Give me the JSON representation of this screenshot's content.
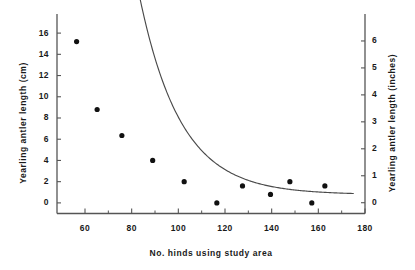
{
  "chart_data": {
    "type": "scatter",
    "title": "",
    "xlabel": "No. hinds using study area",
    "ylabel": "Yearling antler length (cm)",
    "ylabel_right": "Yearling antler length (inches)",
    "xlim": [
      48,
      180
    ],
    "ylim": [
      -1.0,
      17.8
    ],
    "ylim_right": [
      -0.4,
      7.0
    ],
    "grid": false,
    "legend": null,
    "xticks": [
      60,
      80,
      100,
      120,
      140,
      160,
      180
    ],
    "xticklabels": [
      "60",
      "80",
      "100",
      "120",
      "140",
      "160",
      "180"
    ],
    "xminorticks": [
      70,
      90,
      110,
      130,
      150,
      170
    ],
    "yticks": [
      0,
      2,
      4,
      6,
      8,
      10,
      12,
      14,
      16
    ],
    "yticklabels": [
      "0",
      "2",
      "4",
      "6",
      "8",
      "10",
      "12",
      "14",
      "16"
    ],
    "yticks_right": [
      0,
      1,
      2,
      3,
      4,
      5,
      6
    ],
    "yticklabels_right": [
      "0",
      "1",
      "2",
      "3",
      "4",
      "5",
      "6"
    ],
    "unit_conversion": "1 inch = 2.54 cm",
    "marker": "filled-circle",
    "marker_color": "#111111",
    "line_color": "#4a4a4a",
    "axis_color": "#555555",
    "points": [
      {
        "x": 56.4,
        "y": 15.2
      },
      {
        "x": 65.2,
        "y": 8.8
      },
      {
        "x": 75.8,
        "y": 6.35
      },
      {
        "x": 89.0,
        "y": 4.0
      },
      {
        "x": 102.5,
        "y": 2.0
      },
      {
        "x": 116.5,
        "y": 0.0
      },
      {
        "x": 127.5,
        "y": 1.6
      },
      {
        "x": 139.5,
        "y": 0.8
      },
      {
        "x": 147.8,
        "y": 2.0
      },
      {
        "x": 157.2,
        "y": 0.0
      },
      {
        "x": 162.8,
        "y": 1.6
      }
    ],
    "fit_curve": {
      "description": "exponential decay fit to an asymptote",
      "x_start": 52.0,
      "x_end": 175.0,
      "asymptote": 0.78,
      "amplitude": 110.0,
      "decay_rate": 0.0565,
      "samples": [
        {
          "x": 52.0,
          "y": 17.6
        },
        {
          "x": 56.0,
          "y": 15.0
        },
        {
          "x": 60.0,
          "y": 12.4
        },
        {
          "x": 64.0,
          "y": 10.4
        },
        {
          "x": 68.0,
          "y": 8.8
        },
        {
          "x": 72.0,
          "y": 7.5
        },
        {
          "x": 76.0,
          "y": 6.4
        },
        {
          "x": 80.0,
          "y": 5.5
        },
        {
          "x": 85.0,
          "y": 4.5
        },
        {
          "x": 90.0,
          "y": 3.8
        },
        {
          "x": 95.0,
          "y": 3.2
        },
        {
          "x": 100.0,
          "y": 2.7
        },
        {
          "x": 105.0,
          "y": 2.3
        },
        {
          "x": 110.0,
          "y": 2.0
        },
        {
          "x": 115.0,
          "y": 1.8
        },
        {
          "x": 120.0,
          "y": 1.55
        },
        {
          "x": 125.0,
          "y": 1.4
        },
        {
          "x": 130.0,
          "y": 1.25
        },
        {
          "x": 135.0,
          "y": 1.15
        },
        {
          "x": 140.0,
          "y": 1.05
        },
        {
          "x": 145.0,
          "y": 1.0
        },
        {
          "x": 150.0,
          "y": 0.95
        },
        {
          "x": 155.0,
          "y": 0.9
        },
        {
          "x": 160.0,
          "y": 0.88
        },
        {
          "x": 165.0,
          "y": 0.85
        },
        {
          "x": 170.0,
          "y": 0.83
        },
        {
          "x": 175.0,
          "y": 0.82
        }
      ]
    }
  }
}
